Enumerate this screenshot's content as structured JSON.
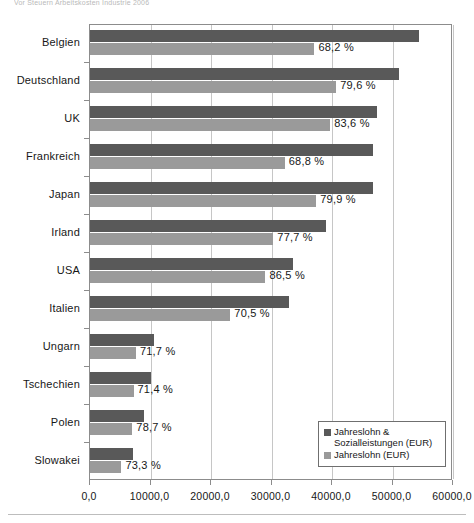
{
  "caption_top": "Vor Steuern Arbeitskosten Industrie 2006",
  "legend": {
    "items": [
      {
        "label": "Jahreslohn & Sozialleistungen (EUR)",
        "color": "#595959",
        "key": "total"
      },
      {
        "label": "Jahreslohn (EUR)",
        "color": "#9a9a9a",
        "key": "wage"
      }
    ]
  },
  "chart_data": {
    "type": "bar",
    "orientation": "horizontal",
    "title": "",
    "xlabel": "",
    "ylabel": "",
    "xlim": [
      0,
      60000
    ],
    "xticks": [
      0,
      10000,
      20000,
      30000,
      40000,
      50000,
      60000
    ],
    "xtick_labels": [
      "0,0",
      "10000,0",
      "20000,0",
      "30000,0",
      "40000,0",
      "50000,0",
      "60000,0"
    ],
    "grid": true,
    "legend_position": "bottom-right",
    "categories": [
      "Belgien",
      "Deutschland",
      "UK",
      "Frankreich",
      "Japan",
      "Irland",
      "USA",
      "Italien",
      "Ungarn",
      "Tschechien",
      "Polen",
      "Slowakei"
    ],
    "series": [
      {
        "name": "Jahreslohn & Sozialleistungen (EUR)",
        "color": "#595959",
        "values": [
          54400,
          51100,
          47500,
          46800,
          46800,
          39000,
          33500,
          32900,
          10600,
          10100,
          8900,
          7100
        ]
      },
      {
        "name": "Jahreslohn (EUR)",
        "color": "#9a9a9a",
        "values": [
          37100,
          40700,
          39700,
          32200,
          37400,
          30300,
          29000,
          23200,
          7600,
          7200,
          7000,
          5200
        ]
      }
    ],
    "data_labels": [
      "68,2 %",
      "79,6 %",
      "83,6 %",
      "68,8 %",
      "79,9 %",
      "77,7 %",
      "86,5 %",
      "70,5 %",
      "71,7 %",
      "71,4 %",
      "78,7 %",
      "73,3 %"
    ],
    "data_label_values": [
      68.2,
      79.6,
      83.6,
      68.8,
      79.9,
      77.7,
      86.5,
      70.5,
      71.7,
      71.4,
      78.7,
      73.3
    ],
    "data_label_note": "Jahreslohn als Anteil von Jahreslohn & Sozialleistungen"
  }
}
